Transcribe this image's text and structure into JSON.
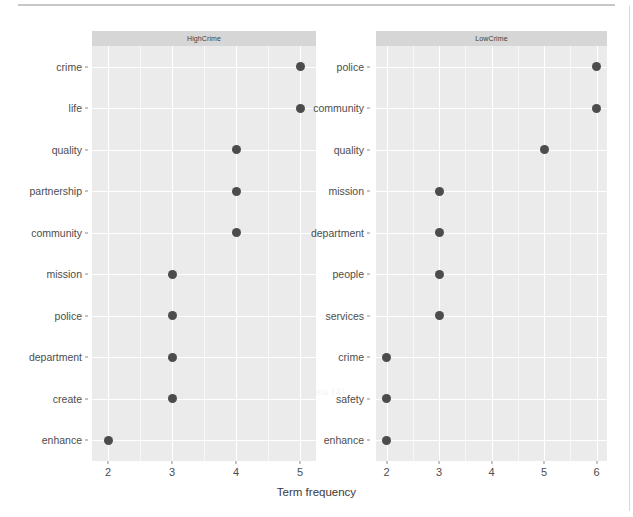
{
  "chart_data": {
    "type": "scatter",
    "subtype": "faceted-cleveland-dot-plot",
    "title": "",
    "xlabel": "Term frequency",
    "ylabel": "",
    "grid": true,
    "legend": false,
    "facet_variable": "crime_level",
    "panels": [
      {
        "label": "HighCrime",
        "xlim": [
          1.75,
          5.25
        ],
        "xticks": [
          2,
          3,
          4,
          5
        ],
        "xtick_labels": [
          "2",
          "3",
          "4",
          "5"
        ],
        "categories": [
          "crime",
          "life",
          "quality",
          "partnership",
          "community",
          "mission",
          "police",
          "department",
          "create",
          "enhance"
        ],
        "values": [
          5,
          5,
          4,
          4,
          4,
          3,
          3,
          3,
          3,
          2
        ],
        "points": [
          {
            "term": "crime",
            "frequency": 5
          },
          {
            "term": "life",
            "frequency": 5
          },
          {
            "term": "quality",
            "frequency": 4
          },
          {
            "term": "partnership",
            "frequency": 4
          },
          {
            "term": "community",
            "frequency": 4
          },
          {
            "term": "mission",
            "frequency": 3
          },
          {
            "term": "police",
            "frequency": 3
          },
          {
            "term": "department",
            "frequency": 3
          },
          {
            "term": "create",
            "frequency": 3
          },
          {
            "term": "enhance",
            "frequency": 2
          }
        ]
      },
      {
        "label": "LowCrime",
        "xlim": [
          1.8,
          6.2
        ],
        "xticks": [
          2,
          3,
          4,
          5,
          6
        ],
        "xtick_labels": [
          "2",
          "3",
          "4",
          "5",
          "6"
        ],
        "categories": [
          "police",
          "community",
          "quality",
          "mission",
          "department",
          "people",
          "services",
          "crime",
          "safety",
          "enhance"
        ],
        "values": [
          6,
          6,
          5,
          3,
          3,
          3,
          3,
          2,
          2,
          2
        ],
        "points": [
          {
            "term": "police",
            "frequency": 6
          },
          {
            "term": "community",
            "frequency": 6
          },
          {
            "term": "quality",
            "frequency": 5
          },
          {
            "term": "mission",
            "frequency": 3
          },
          {
            "term": "department",
            "frequency": 3
          },
          {
            "term": "people",
            "frequency": 3
          },
          {
            "term": "services",
            "frequency": 3
          },
          {
            "term": "crime",
            "frequency": 2
          },
          {
            "term": "safety",
            "frequency": 2
          },
          {
            "term": "enhance",
            "frequency": 2
          }
        ]
      }
    ],
    "colors": {
      "point": "#4c4c4c",
      "panel_background": "#ebebeb",
      "strip_background": "#d6d6d6",
      "gridline": "#ffffff",
      "text": "#4d4d4d"
    }
  },
  "ghost_text": [
    "the purpose",
    "a sense of",
    "is value of",
    "partner of",
    "the value of the residents of the community of the",
    "Committed with the problem",
    "make a world community and 3 Crimes near",
    "mission, and 2, they than a same, will",
    "of (2) both in with priority",
    "neighborhood reform Pistons (4)",
    "Trends, ACT and the 2",
    "Stated 3 to 4"
  ]
}
